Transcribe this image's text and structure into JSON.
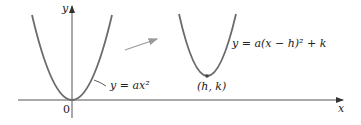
{
  "diagram": {
    "axes": {
      "x_label": "x",
      "y_label": "y",
      "origin_label": "0"
    },
    "curves": [
      {
        "name": "base-parabola",
        "equation": "y = ax²",
        "color": "#6b6b6b"
      },
      {
        "name": "shifted-parabola",
        "equation": "y = a(x − h)² + k",
        "vertex_label": "(h, k)",
        "color": "#6b6b6b"
      }
    ],
    "arrow_color": "#9a9a9a",
    "axis_color": "#555555",
    "text_color": "#222222"
  }
}
